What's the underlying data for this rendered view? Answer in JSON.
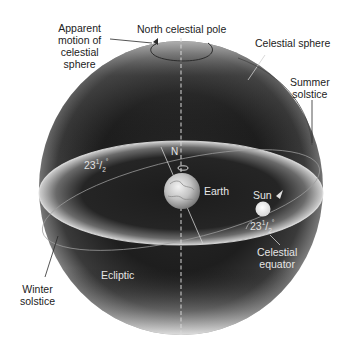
{
  "diagram": {
    "type": "celestial-sphere",
    "colors": {
      "background": "#ffffff",
      "sphere_dark": "#1c1c1c",
      "sphere_edge": "#9a9a9a",
      "band_light": "#d8d8d8",
      "label_dark": "#222222",
      "label_light": "#e6e6e6"
    },
    "labels": {
      "apparent_motion": [
        "Apparent",
        "motion of",
        "celestial",
        "sphere"
      ],
      "north_pole": "North celestial pole",
      "celestial_sphere": "Celestial sphere",
      "summer_solstice": [
        "Summer",
        "solstice"
      ],
      "winter_solstice": [
        "Winter",
        "solstice"
      ],
      "earth": "Earth",
      "sun": "Sun",
      "north": "N",
      "ecliptic": "Ecliptic",
      "celestial_equator": [
        "Celestial",
        "equator"
      ],
      "angle_left": "23",
      "angle_right": "23",
      "angle_fraction_num": "1",
      "angle_fraction_den": "2",
      "degree_sign": "°"
    }
  }
}
